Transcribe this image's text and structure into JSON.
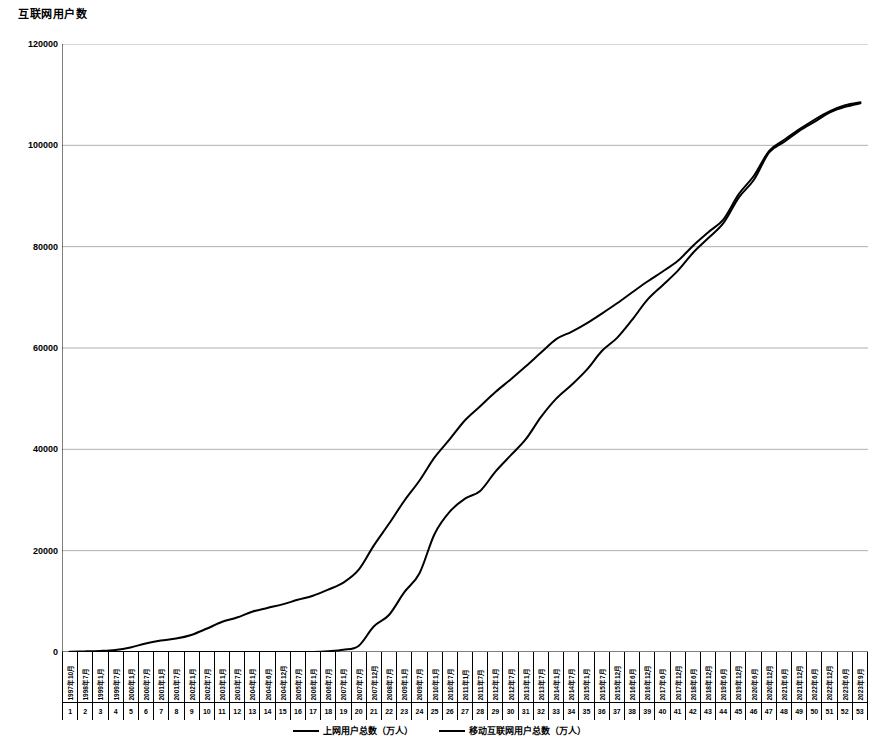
{
  "chart_data": {
    "type": "line",
    "title": "互联网用户数",
    "xlabel": "",
    "ylabel": "",
    "ylim": [
      0,
      120000
    ],
    "yticks": [
      0,
      20000,
      40000,
      60000,
      80000,
      100000,
      120000
    ],
    "ytick_labels": [
      "0",
      "20000",
      "40000",
      "60000",
      "80000",
      "100000",
      "120000"
    ],
    "grid": true,
    "legend_position": "bottom",
    "categories": [
      "1997年10月",
      "1998年7月",
      "1999年1月",
      "1999年7月",
      "2000年1月",
      "2000年7月",
      "2001年1月",
      "2001年7月",
      "2002年1月",
      "2002年7月",
      "2003年1月",
      "2003年7月",
      "2004年1月",
      "2004年6月",
      "2004年12月",
      "2005年7月",
      "2006年1月",
      "2006年7月",
      "2007年1月",
      "2007年7月",
      "2007年12月",
      "2008年7月",
      "2009年1月",
      "2009年7月",
      "2010年1月",
      "2010年7月",
      "2011年1月",
      "2011年7月",
      "2012年1月",
      "2012年7月",
      "2013年1月",
      "2013年7月",
      "2014年1月",
      "2014年7月",
      "2015年1月",
      "2015年7月",
      "2015年12月",
      "2016年6月",
      "2016年12月",
      "2017年6月",
      "2017年12月",
      "2018年6月",
      "2018年12月",
      "2019年6月",
      "2019年12月",
      "2020年6月",
      "2020年12月",
      "2021年6月",
      "2021年12月",
      "2022年6月",
      "2022年12月",
      "2023年6月",
      "2023年9月"
    ],
    "index_labels": [
      "1",
      "2",
      "3",
      "4",
      "5",
      "6",
      "7",
      "8",
      "9",
      "10",
      "11",
      "12",
      "13",
      "14",
      "15",
      "16",
      "17",
      "18",
      "19",
      "20",
      "21",
      "22",
      "23",
      "24",
      "25",
      "26",
      "27",
      "28",
      "29",
      "30",
      "31",
      "32",
      "33",
      "34",
      "35",
      "36",
      "37",
      "38",
      "39",
      "40",
      "41",
      "42",
      "43",
      "44",
      "45",
      "46",
      "47",
      "48",
      "49",
      "50",
      "51",
      "52",
      "53"
    ],
    "series": [
      {
        "name": "上网用户总数（万人）",
        "color": "#000000",
        "values": [
          62,
          118,
          210,
          400,
          890,
          1690,
          2250,
          2650,
          3370,
          4580,
          5910,
          6800,
          7950,
          8700,
          9400,
          10300,
          11100,
          12300,
          13700,
          16200,
          21000,
          25300,
          29800,
          33800,
          38400,
          42000,
          45730,
          48500,
          51310,
          53800,
          56400,
          59100,
          61758,
          63200,
          64875,
          66800,
          68826,
          71000,
          73125,
          75100,
          77198,
          80200,
          82851,
          85400,
          90359,
          94000,
          98900,
          101100,
          103195,
          105100,
          106744,
          107900,
          108500
        ]
      },
      {
        "name": "移动互联网用户总数（万人）",
        "color": "#000000",
        "values": [
          0,
          0,
          0,
          0,
          0,
          0,
          0,
          0,
          0,
          0,
          0,
          0,
          0,
          0,
          0,
          0,
          0,
          150,
          440,
          1200,
          5040,
          7300,
          11760,
          15500,
          23300,
          27700,
          30274,
          31800,
          35600,
          38800,
          41997,
          46400,
          50006,
          52700,
          55678,
          59400,
          62003,
          65600,
          69531,
          72400,
          75265,
          78800,
          81698,
          84700,
          89690,
          93200,
          98600,
          100700,
          102900,
          104700,
          106510,
          107600,
          108300
        ]
      }
    ]
  },
  "legend": {
    "items": [
      {
        "label": "上网用户总数（万人）"
      },
      {
        "label": "移动互联网用户总数（万人）"
      }
    ]
  }
}
